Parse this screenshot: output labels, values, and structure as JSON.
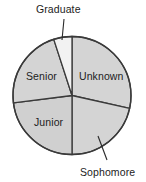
{
  "figure": {
    "name": "pie-chart-student-class-standing",
    "background_color": "#ffffff"
  },
  "chart_data": {
    "type": "pie",
    "title": "",
    "subtitle": "",
    "xlabel": "",
    "ylabel": "",
    "grid": false,
    "legend_position": "none",
    "labels_position": "inside-and-callout",
    "start_angle_deg": 0,
    "direction": "clockwise",
    "categories": [
      "Unknown",
      "Sophomore",
      "Junior",
      "Senior",
      "Graduate"
    ],
    "values": [
      28.5,
      21.5,
      23.0,
      22.0,
      5.0
    ],
    "units": "percent",
    "slices": [
      {
        "label": "Unknown",
        "value": 28.5,
        "start_angle_deg": 0,
        "end_angle_deg": 102.6,
        "sweep_deg": 102.6,
        "fill": "#d4d4d4",
        "stroke": "#3a3a3a",
        "label_placement": "inside",
        "label_x": 79,
        "label_y": 70
      },
      {
        "label": "Sophomore",
        "value": 21.5,
        "start_angle_deg": 102.6,
        "end_angle_deg": 180,
        "sweep_deg": 77.4,
        "fill": "#d4d4d4",
        "stroke": "#3a3a3a",
        "label_placement": "callout",
        "label_x": 80,
        "label_y": 166,
        "leader_from_x": 98,
        "leader_from_y": 136,
        "leader_to_x": 107,
        "leader_to_y": 160
      },
      {
        "label": "Junior",
        "value": 23.0,
        "start_angle_deg": 180,
        "end_angle_deg": 262.8,
        "sweep_deg": 82.8,
        "fill": "#d0d0d0",
        "stroke": "#3a3a3a",
        "label_placement": "inside",
        "label_x": 34,
        "label_y": 116
      },
      {
        "label": "Senior",
        "value": 22.0,
        "start_angle_deg": 262.8,
        "end_angle_deg": 342.0,
        "sweep_deg": 79.2,
        "fill": "#d4d4d4",
        "stroke": "#3a3a3a",
        "label_placement": "inside",
        "label_x": 26,
        "label_y": 70
      },
      {
        "label": "Graduate",
        "value": 5.0,
        "start_angle_deg": 342.0,
        "end_angle_deg": 360,
        "sweep_deg": 18.0,
        "fill": "#f2f2f2",
        "stroke": "#3a3a3a",
        "label_placement": "callout",
        "label_x": 36,
        "label_y": 3,
        "leader_from_x": 62,
        "leader_from_y": 40,
        "leader_to_x": 64,
        "leader_to_y": 19
      }
    ],
    "geometry": {
      "center_x": 72,
      "center_y": 95.5,
      "radius": 59.0
    },
    "colors": {
      "slice_fill_gray": "#d4d4d4",
      "slice_fill_gray_alt": "#d0d0d0",
      "graduate_fill": "#f2f2f2",
      "outline": "#3a3a3a",
      "text": "#1c1c1c",
      "background": "#ffffff"
    }
  },
  "labels": {
    "graduate": "Graduate",
    "senior": "Senior",
    "unknown": "Unknown",
    "junior": "Junior",
    "sophomore": "Sophomore"
  }
}
